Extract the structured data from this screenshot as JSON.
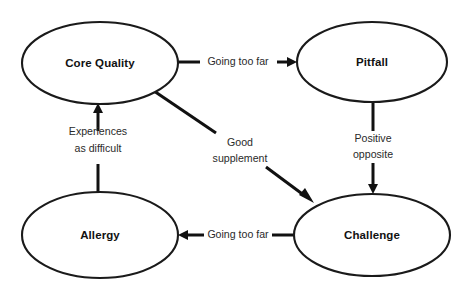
{
  "diagram": {
    "background_color": "#ffffff",
    "stroke_color": "#111111",
    "text_color": "#111111",
    "nodes": [
      {
        "id": "core-quality",
        "label": "Core Quality",
        "cx": 100,
        "cy": 63,
        "rx": 78,
        "ry": 41
      },
      {
        "id": "pitfall",
        "label": "Pitfall",
        "cx": 372,
        "cy": 62,
        "rx": 75,
        "ry": 40
      },
      {
        "id": "allergy",
        "label": "Allergy",
        "cx": 100,
        "cy": 235,
        "rx": 78,
        "ry": 43
      },
      {
        "id": "challenge",
        "label": "Challenge",
        "cx": 372,
        "cy": 235,
        "rx": 78,
        "ry": 41
      }
    ],
    "edges": [
      {
        "id": "core-quality-to-pitfall",
        "label": "Going too far",
        "from": "core-quality",
        "to": "pitfall",
        "label_x": 238,
        "label_y": 62,
        "direction": "right"
      },
      {
        "id": "pitfall-to-challenge",
        "label": "Positive opposite",
        "from": "pitfall",
        "to": "challenge",
        "label_line1": "Positive",
        "label_line2": "opposite",
        "label_x": 373,
        "label_y": 147,
        "direction": "down"
      },
      {
        "id": "challenge-to-allergy",
        "label": "Going too far",
        "from": "challenge",
        "to": "allergy",
        "label_x": 238,
        "label_y": 235,
        "direction": "left"
      },
      {
        "id": "allergy-to-core-quality",
        "label": "Experiences as difficult",
        "from": "allergy",
        "to": "core-quality",
        "label_line1": "Experiences",
        "label_line2": "as difficult",
        "label_x": 98,
        "label_y": 141,
        "direction": "up"
      },
      {
        "id": "core-quality-to-challenge",
        "label": "Good supplement",
        "from": "core-quality",
        "to": "challenge",
        "label_line1": "Good",
        "label_line2": "supplement",
        "label_x": 240,
        "label_y": 150,
        "direction": "diagonal-down-right"
      }
    ]
  }
}
